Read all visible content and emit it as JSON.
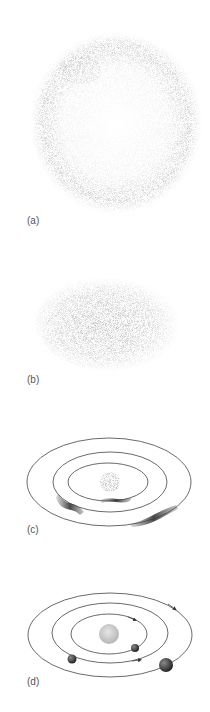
{
  "panels": [
    {
      "id": "a",
      "label": "(a)",
      "description": "diffuse nebula cloud"
    },
    {
      "id": "b",
      "label": "(b)",
      "description": "flattened rotating disk with dense center"
    },
    {
      "id": "c",
      "label": "(c)",
      "description": "rings with clumping matter around central star"
    },
    {
      "id": "d",
      "label": "(d)",
      "description": "planets orbiting central star"
    }
  ],
  "colors": {
    "ink": "#333333",
    "cloud": "#9a9a9a",
    "dark": "#3a3a3a",
    "sun": "#cfcfcf"
  }
}
